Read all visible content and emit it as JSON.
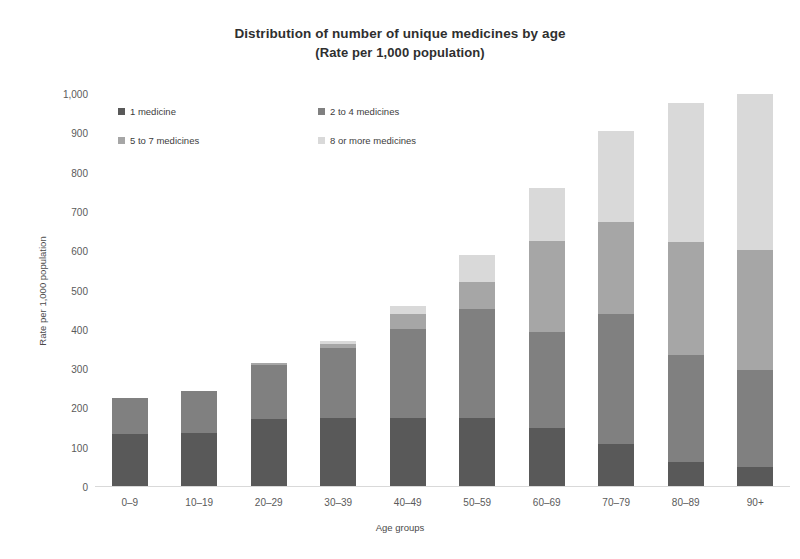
{
  "chart_data": {
    "type": "bar",
    "subtype": "stacked-column",
    "title": "Distribution of number of unique medicines by age",
    "subtitle": "(Rate per 1,000 population)",
    "xlabel": "Age groups",
    "ylabel": "Rate per 1,000 population",
    "ylim": [
      0,
      1000
    ],
    "ytick_step": 100,
    "ytick_labels": [
      "0",
      "100",
      "200",
      "300",
      "400",
      "500",
      "600",
      "700",
      "800",
      "900",
      "1,000"
    ],
    "ytick_values": [
      0,
      100,
      200,
      300,
      400,
      500,
      600,
      700,
      800,
      900,
      1000
    ],
    "grid": false,
    "legend_position": "top-left-inside",
    "categories": [
      "0–9",
      "10–19",
      "20–29",
      "30–39",
      "40–49",
      "50–59",
      "60–69",
      "70–79",
      "80–89",
      "90+"
    ],
    "series": [
      {
        "name": "1 medicine",
        "color": "#595959",
        "values": [
          135,
          138,
          172,
          175,
          176,
          176,
          150,
          110,
          64,
          51
        ]
      },
      {
        "name": "2 to 4 medicines",
        "color": "#808080",
        "values": [
          91,
          106,
          139,
          178,
          225,
          277,
          245,
          330,
          272,
          248
        ]
      },
      {
        "name": "5 to 7 medicines",
        "color": "#a6a6a6",
        "values": [
          0,
          0,
          5,
          12,
          40,
          69,
          230,
          235,
          288,
          305
        ]
      },
      {
        "name": "8 or more medicines",
        "color": "#d9d9d9",
        "values": [
          0,
          0,
          0,
          7,
          19,
          68,
          135,
          230,
          354,
          396
        ]
      }
    ],
    "totals": [
      226,
      244,
      316,
      372,
      460,
      590,
      760,
      905,
      978,
      1000
    ]
  },
  "axis": {
    "x_title": "Age groups",
    "y_title": "Rate per 1,000 population"
  }
}
